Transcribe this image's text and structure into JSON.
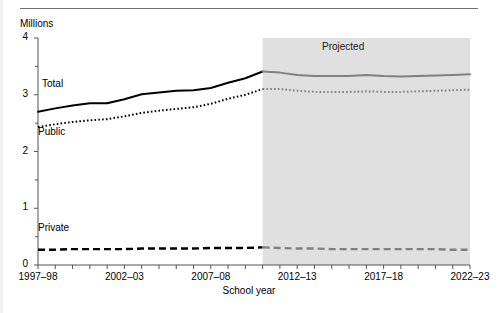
{
  "figure": {
    "ylabel": "Millions",
    "xlabel": "School year",
    "projected_label": "Projected",
    "series_labels": {
      "total": "Total",
      "public": "Public",
      "private": "Private"
    }
  },
  "chart_data": {
    "type": "line",
    "title": "",
    "subtitle": "",
    "xlabel": "School year",
    "ylabel": "Millions",
    "ylim": [
      0,
      4
    ],
    "yticks": [
      0,
      1,
      2,
      3,
      4
    ],
    "ytick_labels": [
      "0",
      "1",
      "2",
      "3",
      "4"
    ],
    "yminor_step": 0.5,
    "grid": false,
    "legend": "inline-labels",
    "annotations": [
      {
        "text": "Projected",
        "x_category": "2015–16",
        "y": 3.75
      },
      {
        "text": "Total",
        "x_category": "1999–2000",
        "y": 3.05
      },
      {
        "text": "Public",
        "x_category": "1998–99",
        "y": 2.3
      },
      {
        "text": "Private",
        "x_category": "1998–99",
        "y": 0.6
      }
    ],
    "projection_start_category": "2010–11",
    "x": [
      "1997–98",
      "1998–99",
      "1999–2000",
      "2000–01",
      "2001–02",
      "2002–03",
      "2003–04",
      "2004–05",
      "2005–06",
      "2006–07",
      "2007–08",
      "2008–09",
      "2009–10",
      "2010–11",
      "2011–12",
      "2012–13",
      "2013–14",
      "2014–15",
      "2015–16",
      "2016–17",
      "2017–18",
      "2018–19",
      "2019–20",
      "2020–21",
      "2021–22",
      "2022–23"
    ],
    "xtick_labels_shown": [
      "1997–98",
      "2002–03",
      "2007–08",
      "2012–13",
      "2017–18",
      "2022–23"
    ],
    "series": [
      {
        "name": "Total",
        "style": "solid",
        "values": [
          2.7,
          2.76,
          2.81,
          2.85,
          2.85,
          2.92,
          3.01,
          3.04,
          3.07,
          3.08,
          3.12,
          3.21,
          3.29,
          3.41,
          3.39,
          3.35,
          3.33,
          3.33,
          3.33,
          3.35,
          3.33,
          3.32,
          3.33,
          3.34,
          3.35,
          3.36
        ]
      },
      {
        "name": "Public",
        "style": "dotted",
        "values": [
          2.43,
          2.48,
          2.52,
          2.55,
          2.57,
          2.62,
          2.68,
          2.72,
          2.75,
          2.78,
          2.84,
          2.93,
          3.0,
          3.1,
          3.1,
          3.07,
          3.05,
          3.05,
          3.05,
          3.06,
          3.05,
          3.05,
          3.06,
          3.07,
          3.08,
          3.09
        ]
      },
      {
        "name": "Private",
        "style": "dashed",
        "values": [
          0.27,
          0.27,
          0.28,
          0.28,
          0.28,
          0.28,
          0.29,
          0.29,
          0.29,
          0.29,
          0.3,
          0.3,
          0.3,
          0.31,
          0.3,
          0.29,
          0.29,
          0.28,
          0.28,
          0.28,
          0.28,
          0.28,
          0.28,
          0.28,
          0.27,
          0.27
        ]
      }
    ],
    "colors": {
      "historical": "#000000",
      "projected": "#808080",
      "projection_band": "#e0e0e0",
      "axis": "#555555",
      "text": "#000000"
    }
  }
}
